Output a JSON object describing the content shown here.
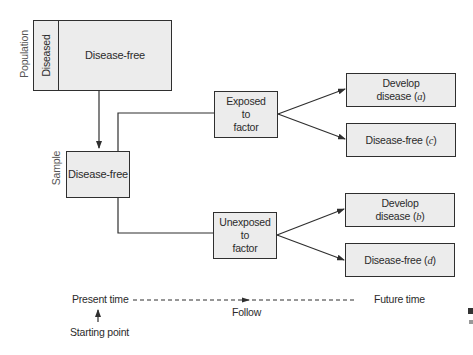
{
  "diagram": {
    "type": "prospective-cohort-study-design",
    "population": {
      "side_label": "Population",
      "diseased_label": "Diseased",
      "disease_free_label": "Disease-free"
    },
    "sample": {
      "side_label": "Sample",
      "label": "Disease-free"
    },
    "groups": [
      {
        "label_line1": "Exposed",
        "label_line2": "to",
        "label_line3": "factor",
        "outcomes": [
          {
            "line1": "Develop",
            "line2_prefix": "disease (",
            "letter": "a",
            "suffix": ")"
          },
          {
            "line1": "",
            "line2_prefix": "Disease-free (",
            "letter": "c",
            "suffix": ")"
          }
        ]
      },
      {
        "label_line1": "Unexposed",
        "label_line2": "to",
        "label_line3": "factor",
        "outcomes": [
          {
            "line1": "Develop",
            "line2_prefix": "disease (",
            "letter": "b",
            "suffix": ")"
          },
          {
            "line1": "",
            "line2_prefix": "Disease-free (",
            "letter": "d",
            "suffix": ")"
          }
        ]
      }
    ],
    "timeline": {
      "start_label": "Present time",
      "middle_label": "Follow",
      "end_label": "Future time",
      "starting_point_label": "Starting point"
    },
    "colors": {
      "box_fill": "#ececec",
      "line": "#2f2f2f",
      "text": "#2b2b2b"
    }
  }
}
